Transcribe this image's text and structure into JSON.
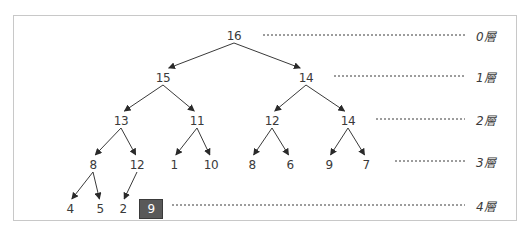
{
  "diagram": {
    "type": "binary-tree (heap)",
    "nodes": [
      {
        "id": "n0",
        "value": "16",
        "level": 0,
        "x": 234,
        "y": 36
      },
      {
        "id": "n1",
        "value": "15",
        "level": 1,
        "x": 163,
        "y": 78
      },
      {
        "id": "n2",
        "value": "14",
        "level": 1,
        "x": 306,
        "y": 78
      },
      {
        "id": "n3",
        "value": "13",
        "level": 2,
        "x": 121,
        "y": 121
      },
      {
        "id": "n4",
        "value": "11",
        "level": 2,
        "x": 197,
        "y": 121
      },
      {
        "id": "n5",
        "value": "12",
        "level": 2,
        "x": 272,
        "y": 121
      },
      {
        "id": "n6",
        "value": "14",
        "level": 2,
        "x": 348,
        "y": 121
      },
      {
        "id": "n7",
        "value": "8",
        "level": 3,
        "x": 93,
        "y": 165
      },
      {
        "id": "n8",
        "value": "12",
        "level": 3,
        "x": 137,
        "y": 165
      },
      {
        "id": "n9",
        "value": "1",
        "level": 3,
        "x": 174,
        "y": 165
      },
      {
        "id": "n10",
        "value": "10",
        "level": 3,
        "x": 211,
        "y": 165
      },
      {
        "id": "n11",
        "value": "8",
        "level": 3,
        "x": 252,
        "y": 165
      },
      {
        "id": "n12",
        "value": "6",
        "level": 3,
        "x": 290,
        "y": 165
      },
      {
        "id": "n13",
        "value": "9",
        "level": 3,
        "x": 329,
        "y": 165
      },
      {
        "id": "n14",
        "value": "7",
        "level": 3,
        "x": 366,
        "y": 165
      },
      {
        "id": "n15",
        "value": "4",
        "level": 4,
        "x": 70,
        "y": 209
      },
      {
        "id": "n16",
        "value": "5",
        "level": 4,
        "x": 100,
        "y": 209
      },
      {
        "id": "n17",
        "value": "2",
        "level": 4,
        "x": 123,
        "y": 209
      },
      {
        "id": "n18",
        "value": "9",
        "level": 4,
        "x": 151,
        "y": 209,
        "highlighted": true
      }
    ],
    "edges": [
      [
        "n0",
        "n1"
      ],
      [
        "n0",
        "n2"
      ],
      [
        "n1",
        "n3"
      ],
      [
        "n1",
        "n4"
      ],
      [
        "n2",
        "n5"
      ],
      [
        "n2",
        "n6"
      ],
      [
        "n3",
        "n7"
      ],
      [
        "n3",
        "n8"
      ],
      [
        "n4",
        "n9"
      ],
      [
        "n4",
        "n10"
      ],
      [
        "n5",
        "n11"
      ],
      [
        "n5",
        "n12"
      ],
      [
        "n6",
        "n13"
      ],
      [
        "n6",
        "n14"
      ],
      [
        "n7",
        "n15"
      ],
      [
        "n7",
        "n16"
      ],
      [
        "n8",
        "n17"
      ]
    ],
    "levels": [
      {
        "label": "0層",
        "y": 35,
        "x1": 263,
        "x2": 465
      },
      {
        "label": "1層",
        "y": 76,
        "x1": 334,
        "x2": 465
      },
      {
        "label": "2層",
        "y": 119,
        "x1": 376,
        "x2": 465
      },
      {
        "label": "3層",
        "y": 161,
        "x1": 395,
        "x2": 465
      },
      {
        "label": "4層",
        "y": 205,
        "x1": 172,
        "x2": 465
      }
    ],
    "colors": {
      "line": "#3a3a3a",
      "highlight_fill": "#595959",
      "highlight_text": "#ffffff",
      "frame": "#c8c8c8"
    }
  }
}
